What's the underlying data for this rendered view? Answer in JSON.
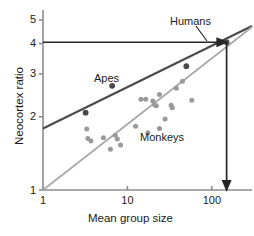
{
  "chart_data": {
    "type": "scatter",
    "title": "",
    "xlabel": "Mean group size",
    "ylabel": "Neocortex ratio",
    "xscale": "log",
    "yscale": "log",
    "xlim": [
      1,
      300
    ],
    "ylim": [
      1,
      5.6
    ],
    "xticks": [
      1,
      10,
      100
    ],
    "xtick_labels": [
      "1",
      "10",
      "100"
    ],
    "yticks": [
      1,
      2,
      3,
      4,
      5
    ],
    "ytick_labels": [
      "1",
      "2",
      "3",
      "4",
      "5"
    ],
    "grid": false,
    "legend": "none",
    "colors": {
      "apes": "#4a4a4a",
      "monkeys": "#9a9a9a",
      "apes_line": "#4a4a4a",
      "monkeys_line": "#a8a8a8",
      "axis": "#8c8c8c",
      "arrow": "#262626",
      "text": "#1a1a1a"
    },
    "series": [
      {
        "name": "Apes",
        "color": "#4a4a4a",
        "points": [
          {
            "x": 3.2,
            "y": 2.08
          },
          {
            "x": 6.6,
            "y": 2.68
          },
          {
            "x": 50,
            "y": 3.23
          },
          {
            "x": 150,
            "y": 4.05
          }
        ],
        "trendline": {
          "name": "apes-regression-line",
          "x_start": 1.0,
          "y_start": 1.79,
          "x_end": 300,
          "y_end": 4.72
        }
      },
      {
        "name": "Monkeys",
        "color": "#9a9a9a",
        "points": [
          {
            "x": 3.3,
            "y": 1.78
          },
          {
            "x": 3.4,
            "y": 1.63
          },
          {
            "x": 3.7,
            "y": 1.59
          },
          {
            "x": 5.2,
            "y": 1.64
          },
          {
            "x": 6.3,
            "y": 1.47
          },
          {
            "x": 7.2,
            "y": 1.68
          },
          {
            "x": 7.6,
            "y": 1.62
          },
          {
            "x": 8.3,
            "y": 1.53
          },
          {
            "x": 12.5,
            "y": 1.83
          },
          {
            "x": 14.5,
            "y": 2.36
          },
          {
            "x": 16.5,
            "y": 2.36
          },
          {
            "x": 17.5,
            "y": 1.72
          },
          {
            "x": 20,
            "y": 2.32
          },
          {
            "x": 21,
            "y": 2.24
          },
          {
            "x": 22,
            "y": 2.22
          },
          {
            "x": 24,
            "y": 2.47
          },
          {
            "x": 24,
            "y": 1.79
          },
          {
            "x": 28,
            "y": 1.96
          },
          {
            "x": 33,
            "y": 2.23
          },
          {
            "x": 34,
            "y": 2.18
          },
          {
            "x": 38,
            "y": 2.62
          },
          {
            "x": 45,
            "y": 2.8
          },
          {
            "x": 58,
            "y": 2.34
          }
        ],
        "trendline": {
          "name": "monkeys-regression-line",
          "x_start": 1.0,
          "y_start": 1.0,
          "x_end": 300,
          "y_end": 4.68
        }
      }
    ],
    "annotations": [
      {
        "name": "humans-label",
        "text": "Humans",
        "x_px": 170,
        "y_px": 16,
        "leader_line": {
          "from_x_px": 196,
          "from_y_px": 26,
          "to_x_px": 207,
          "to_y_px": 41
        }
      },
      {
        "name": "apes-label",
        "text": "Apes",
        "x_px": 94,
        "y_px": 73
      },
      {
        "name": "monkeys-label",
        "text": "Monkeys",
        "x_px": 140,
        "y_px": 132
      }
    ],
    "arrows": [
      {
        "name": "horizontal-arrow-to-humans",
        "orientation": "horizontal",
        "from": {
          "x": 1,
          "y": 4.05
        },
        "to": {
          "x": 150,
          "y": 4.05
        },
        "description": "arrow from Neocortex ratio 4 across to the Humans point"
      },
      {
        "name": "vertical-arrow-to-group-size",
        "orientation": "vertical",
        "from": {
          "x": 150,
          "y": 4.05
        },
        "to": {
          "x": 150,
          "y": 1.0
        },
        "description": "arrow from the Humans point down to Mean group size 150"
      }
    ]
  },
  "axes": {
    "x_axis_title": "Mean group size",
    "y_axis_title": "Neocortex ratio",
    "x_tick_labels": [
      "1",
      "10",
      "100"
    ],
    "y_tick_labels": [
      "1",
      "2",
      "3",
      "4",
      "5"
    ]
  },
  "labels": {
    "humans": "Humans",
    "apes": "Apes",
    "monkeys": "Monkeys"
  }
}
